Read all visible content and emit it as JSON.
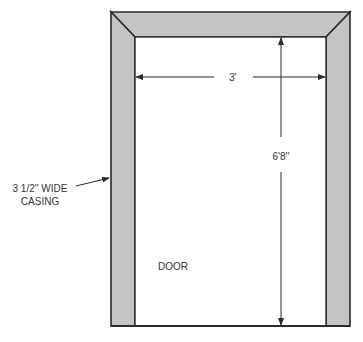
{
  "diagram": {
    "labels": {
      "width": "3'",
      "height": "6'8''",
      "casing_line1": "3 1/2'' WIDE",
      "casing_line2": "CASING",
      "door": "DOOR"
    },
    "colors": {
      "casing_fill": "#c4c4c4",
      "stroke": "#2a2a2a",
      "background": "#ffffff"
    },
    "geometry": {
      "outer": {
        "left": 111,
        "top": 12,
        "right": 350,
        "bottom": 326
      },
      "inner": {
        "left": 135,
        "top": 37,
        "right": 326,
        "bottom": 326
      }
    }
  }
}
